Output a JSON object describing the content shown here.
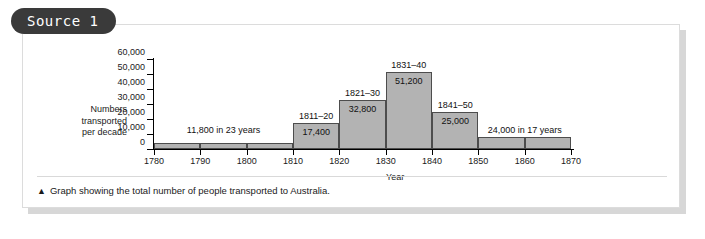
{
  "source_badge": {
    "label": "Source 1"
  },
  "caption": {
    "marker": "▲",
    "text": "Graph showing the total number of people transported to Australia."
  },
  "colors": {
    "bar_fill": "#b3b3b3",
    "bar_stroke": "#4d4d4d",
    "badge_bg": "#3a3a3a",
    "card_border": "#dcdcdc",
    "text": "#1a1a1a"
  },
  "chart_data": {
    "type": "bar",
    "title": "",
    "xlabel": "Year",
    "ylabel": "Numbers transported per decade",
    "ylabel_lines": [
      "Numbers",
      "transported",
      "per decade"
    ],
    "xlim": [
      1780,
      1870
    ],
    "ylim": [
      0,
      60000
    ],
    "grid": false,
    "legend": "none",
    "ytick_labels": [
      "60,000",
      "50,000",
      "40,000",
      "30,000",
      "20,000",
      "10,000",
      "0"
    ],
    "ytick_values": [
      60000,
      50000,
      40000,
      30000,
      20000,
      10000,
      0
    ],
    "xtick_labels": [
      "1780",
      "1790",
      "1800",
      "1810",
      "1820",
      "1830",
      "1840",
      "1850",
      "1860",
      "1870"
    ],
    "xtick_values": [
      1780,
      1790,
      1800,
      1810,
      1820,
      1830,
      1840,
      1850,
      1860,
      1870
    ],
    "categories": [
      "1781-90",
      "1791-1800",
      "1801-10",
      "1811-20",
      "1821-30",
      "1831-40",
      "1841-50",
      "1851-60",
      "1861-70"
    ],
    "values": [
      3900,
      3900,
      4000,
      17400,
      32800,
      51200,
      25000,
      8000,
      8000
    ],
    "bars": [
      {
        "start": 1780,
        "end": 1790,
        "value": 3900,
        "value_label": "",
        "period_label": ""
      },
      {
        "start": 1790,
        "end": 1800,
        "value": 3900,
        "value_label": "",
        "period_label": ""
      },
      {
        "start": 1800,
        "end": 1810,
        "value": 4000,
        "value_label": "",
        "period_label": ""
      },
      {
        "start": 1810,
        "end": 1820,
        "value": 17400,
        "value_label": "17,400",
        "period_label": "1811–20"
      },
      {
        "start": 1820,
        "end": 1830,
        "value": 32800,
        "value_label": "32,800",
        "period_label": "1821–30"
      },
      {
        "start": 1830,
        "end": 1840,
        "value": 51200,
        "value_label": "51,200",
        "period_label": "1831–40"
      },
      {
        "start": 1840,
        "end": 1850,
        "value": 25000,
        "value_label": "25,000",
        "period_label": "1841–50"
      },
      {
        "start": 1850,
        "end": 1860,
        "value": 8000,
        "value_label": "",
        "period_label": ""
      },
      {
        "start": 1860,
        "end": 1870,
        "value": 8000,
        "value_label": "",
        "period_label": ""
      }
    ],
    "annotations": [
      {
        "text": "11,800 in 23 years",
        "span_start": 1780,
        "span_end": 1810
      },
      {
        "text": "24,000 in 17 years",
        "span_start": 1850,
        "span_end": 1870
      }
    ]
  }
}
